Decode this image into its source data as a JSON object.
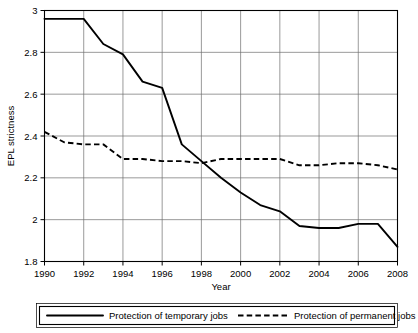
{
  "chart_data": {
    "type": "line",
    "title": "",
    "xlabel": "Year",
    "ylabel": "EPL strictness",
    "xlim": [
      1990,
      2008
    ],
    "ylim": [
      1.8,
      3.0
    ],
    "grid": true,
    "legend_position": "bottom",
    "x": [
      1990,
      1991,
      1992,
      1993,
      1994,
      1995,
      1996,
      1997,
      1998,
      1999,
      2000,
      2001,
      2002,
      2003,
      2004,
      2005,
      2006,
      2007,
      2008
    ],
    "xtick_labels": [
      "1990",
      "1992",
      "1994",
      "1996",
      "1998",
      "2000",
      "2002",
      "2004",
      "2006",
      "2008"
    ],
    "xticks": [
      1990,
      1992,
      1994,
      1996,
      1998,
      2000,
      2002,
      2004,
      2006,
      2008
    ],
    "ytick_labels": [
      "1.8",
      "2",
      "2.2",
      "2.4",
      "2.6",
      "2.8",
      "3"
    ],
    "yticks": [
      1.8,
      2.0,
      2.2,
      2.4,
      2.6,
      2.8,
      3.0
    ],
    "series": [
      {
        "name": "Protection of temporary jobs",
        "style": "solid",
        "color": "#000000",
        "values": [
          2.96,
          2.96,
          2.96,
          2.84,
          2.79,
          2.66,
          2.63,
          2.36,
          2.28,
          2.2,
          2.13,
          2.07,
          2.04,
          1.97,
          1.96,
          1.96,
          1.98,
          1.98,
          1.87
        ]
      },
      {
        "name": "Protection of permanent jobs",
        "style": "dashed",
        "color": "#000000",
        "values": [
          2.42,
          2.37,
          2.36,
          2.36,
          2.29,
          2.29,
          2.28,
          2.28,
          2.27,
          2.29,
          2.29,
          2.29,
          2.29,
          2.26,
          2.26,
          2.27,
          2.27,
          2.26,
          2.24
        ]
      }
    ]
  },
  "legend": {
    "entries": [
      {
        "label": "Protection of temporary jobs",
        "style": "solid"
      },
      {
        "label": "Protection of permanent jobs",
        "style": "dashed"
      }
    ]
  }
}
